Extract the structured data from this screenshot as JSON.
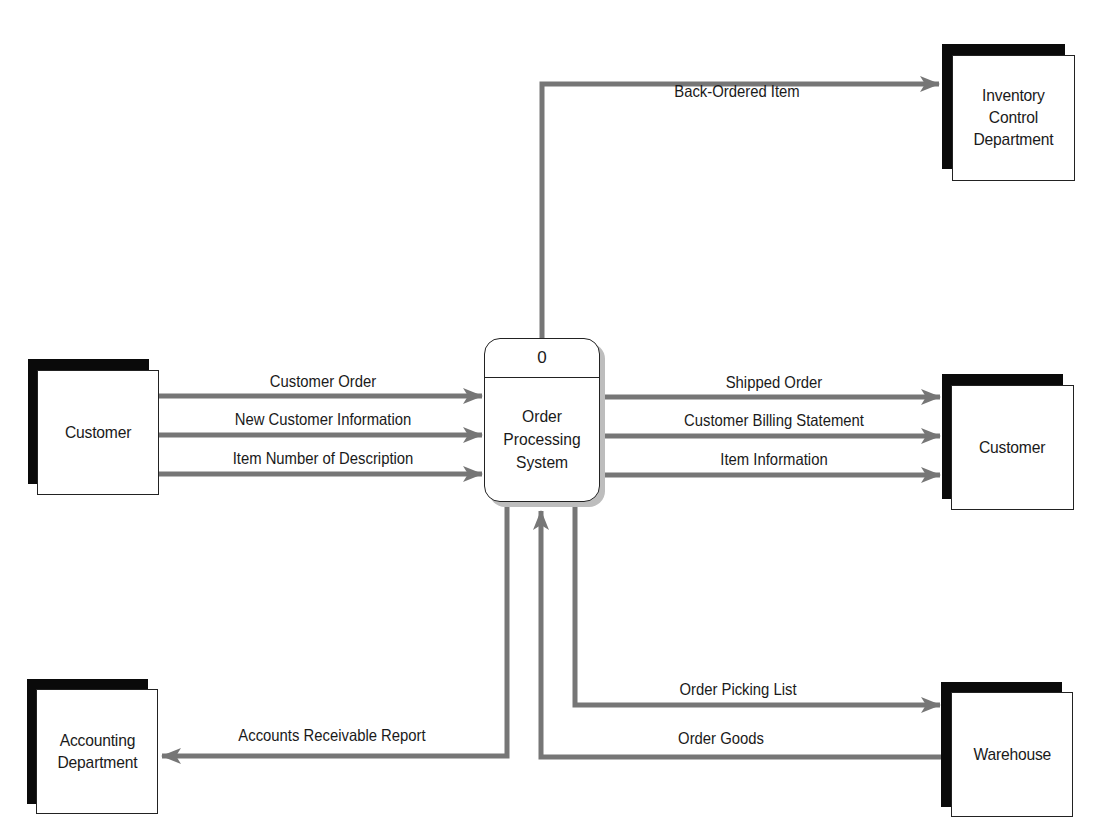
{
  "diagram": {
    "type": "context data flow diagram",
    "colors": {
      "flow": "#767676",
      "shadow": "#0a0a0a",
      "border": "#222222",
      "process_shadow": "#bdbdbd"
    },
    "process": {
      "id": "0",
      "name": "Order\nProcessing\nSystem"
    },
    "entities": {
      "inventory": {
        "label": "Inventory\nControl\nDepartment"
      },
      "customer_left": {
        "label": "Customer"
      },
      "customer_right": {
        "label": "Customer"
      },
      "accounting": {
        "label": "Accounting\nDepartment"
      },
      "warehouse": {
        "label": "Warehouse"
      }
    },
    "flows": {
      "back_ordered_item": {
        "label": "Back-Ordered Item",
        "from": "process",
        "to": "inventory"
      },
      "customer_order": {
        "label": "Customer Order",
        "from": "customer_left",
        "to": "process"
      },
      "new_customer_information": {
        "label": "New Customer Information",
        "from": "customer_left",
        "to": "process"
      },
      "item_number_of_description": {
        "label": "Item Number of Description",
        "from": "customer_left",
        "to": "process"
      },
      "shipped_order": {
        "label": "Shipped Order",
        "from": "process",
        "to": "customer_right"
      },
      "customer_billing_statement": {
        "label": "Customer Billing Statement",
        "from": "process",
        "to": "customer_right"
      },
      "item_information": {
        "label": "Item Information",
        "from": "process",
        "to": "customer_right"
      },
      "accounts_receivable_report": {
        "label": "Accounts Receivable Report",
        "from": "process",
        "to": "accounting"
      },
      "order_picking_list": {
        "label": "Order Picking List",
        "from": "process",
        "to": "warehouse"
      },
      "order_goods": {
        "label": "Order Goods",
        "from": "warehouse",
        "to": "process"
      }
    }
  }
}
